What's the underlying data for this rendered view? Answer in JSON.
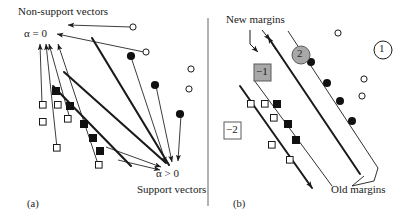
{
  "figure": {
    "type": "diagram",
    "background_color": "#ffffff",
    "ink_color": "#1a1a1a",
    "divider": {
      "x": 208,
      "y_top": 18,
      "y_bottom": 206,
      "color": "#777777"
    }
  },
  "panel_a": {
    "caption": "(a)",
    "labels": {
      "non_support": "Non-support vectors",
      "alpha_zero": "α = 0",
      "alpha_positive": "α > 0",
      "support": "Support vectors"
    },
    "markers": {
      "filled_circle_label": "support-vector-class-positive",
      "open_circle_label": "non-support-vector-class-positive",
      "filled_square_label": "support-vector-class-negative",
      "open_square_label": "non-support-vector-class-negative",
      "filled_circles": [
        [
          131,
          56
        ],
        [
          155,
          85
        ],
        [
          180,
          114
        ]
      ],
      "open_circles": [
        [
          133,
          27
        ],
        [
          146,
          52
        ],
        [
          191,
          69
        ],
        [
          189,
          89
        ]
      ],
      "filled_squares": [
        [
          56,
          91
        ],
        [
          70,
          106
        ],
        [
          84,
          124
        ],
        [
          93,
          138
        ],
        [
          100,
          151
        ]
      ],
      "open_squares": [
        [
          43,
          105
        ],
        [
          58,
          106
        ],
        [
          68,
          119
        ],
        [
          70,
          146
        ],
        [
          100,
          165
        ]
      ]
    },
    "margin_lines": [
      {
        "name": "upper-margin",
        "x1": 92,
        "y1": 38,
        "x2": 168,
        "y2": 164
      },
      {
        "name": "lower-margin",
        "x1": 53,
        "y1": 87,
        "x2": 130,
        "y2": 166
      }
    ],
    "arrow_groups": {
      "to_alpha_zero": 6,
      "to_alpha_positive": 5
    }
  },
  "panel_b": {
    "caption": "(b)",
    "labels": {
      "new_margins": "New margins",
      "old_margins": "Old margins",
      "region_one": "1",
      "region_two": "2",
      "region_minus_one": "−1",
      "region_minus_two": "−2"
    },
    "markers": {
      "filled_circles": [
        [
          311,
          62
        ],
        [
          327,
          83
        ],
        [
          340,
          101
        ],
        [
          352,
          121
        ]
      ],
      "open_circles": [
        [
          338,
          33
        ],
        [
          364,
          79
        ],
        [
          362,
          96
        ]
      ],
      "filled_squares": [
        [
          277,
          104
        ],
        [
          288,
          124
        ],
        [
          296,
          140
        ]
      ],
      "open_squares": [
        [
          251,
          104
        ],
        [
          265,
          104
        ],
        [
          274,
          118
        ],
        [
          272,
          145
        ],
        [
          290,
          160
        ]
      ]
    },
    "badges": {
      "circle_one": {
        "x": 383,
        "y": 50,
        "r": 9,
        "fill": "#ffffff",
        "stroke": "#1a1a1a"
      },
      "circle_two": {
        "x": 301,
        "y": 55,
        "r": 9,
        "fill": "#a8a8a8",
        "stroke": "#555555"
      },
      "square_minus_one": {
        "x": 262,
        "y": 72,
        "size": 17,
        "fill": "#a8a8a8",
        "stroke": "#555555"
      },
      "square_minus_two": {
        "x": 232,
        "y": 130,
        "size": 17,
        "fill": "#ffffff",
        "stroke": "#555555"
      }
    },
    "margin_bands": {
      "new_upper": {
        "x1": 268,
        "y1": 37,
        "x2": 360,
        "y2": 175
      },
      "new_lower": {
        "x1": 240,
        "y1": 85,
        "x2": 310,
        "y2": 190
      },
      "old_upper": {
        "x1": 285,
        "y1": 32,
        "x2": 378,
        "y2": 170
      },
      "old_lower": {
        "x1": 256,
        "y1": 80,
        "x2": 330,
        "y2": 186
      }
    }
  }
}
